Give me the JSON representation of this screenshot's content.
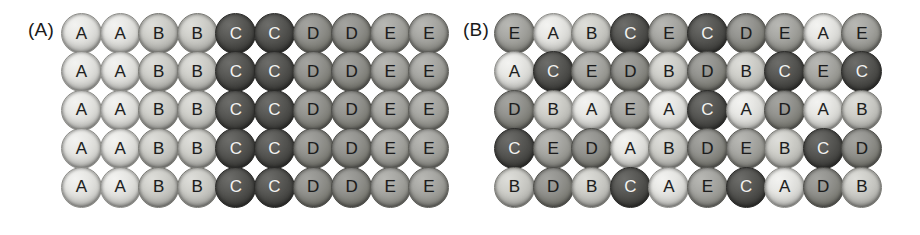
{
  "figure": {
    "background_color": "#ffffff",
    "panels": [
      {
        "id": "panel-a",
        "label": "(A)",
        "rows": 5,
        "columns": 10,
        "grid": [
          [
            "A",
            "A",
            "B",
            "B",
            "C",
            "C",
            "D",
            "D",
            "E",
            "E"
          ],
          [
            "A",
            "A",
            "B",
            "B",
            "C",
            "C",
            "D",
            "D",
            "E",
            "E"
          ],
          [
            "A",
            "A",
            "B",
            "B",
            "C",
            "C",
            "D",
            "D",
            "E",
            "E"
          ],
          [
            "A",
            "A",
            "B",
            "B",
            "C",
            "C",
            "D",
            "D",
            "E",
            "E"
          ],
          [
            "A",
            "A",
            "B",
            "B",
            "C",
            "C",
            "D",
            "D",
            "E",
            "E"
          ]
        ]
      },
      {
        "id": "panel-b",
        "label": "(B)",
        "rows": 5,
        "columns": 10,
        "grid": [
          [
            "E",
            "A",
            "B",
            "C",
            "E",
            "C",
            "D",
            "E",
            "A",
            "E"
          ],
          [
            "A",
            "C",
            "E",
            "D",
            "B",
            "D",
            "B",
            "C",
            "E",
            "C"
          ],
          [
            "D",
            "B",
            "A",
            "E",
            "A",
            "C",
            "A",
            "D",
            "A",
            "B"
          ],
          [
            "C",
            "E",
            "D",
            "A",
            "B",
            "D",
            "E",
            "B",
            "C",
            "D"
          ],
          [
            "B",
            "D",
            "B",
            "C",
            "A",
            "E",
            "C",
            "A",
            "D",
            "B"
          ]
        ]
      }
    ],
    "legend_shades": {
      "A": "#e7e7e4",
      "B": "#cfcfca",
      "C": "#5a5a57",
      "D": "#949490",
      "E": "#a8a8a4"
    }
  }
}
